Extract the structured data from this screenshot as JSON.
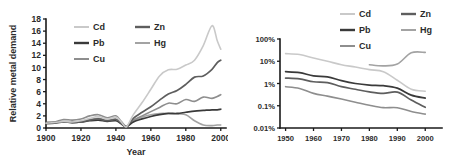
{
  "figure": {
    "background": "#ffffff",
    "panels": [
      "left",
      "right"
    ]
  },
  "series_colors": {
    "Cd": "#c9c9c9",
    "Pb": "#3a3a3a",
    "Cu": "#8e8e8e",
    "Zn": "#5e5e5e",
    "Hg": "#a3a3a3"
  },
  "legend": {
    "entries": [
      {
        "label": "Cd",
        "color": "#c9c9c9"
      },
      {
        "label": "Zn",
        "color": "#5e5e5e"
      },
      {
        "label": "Pb",
        "color": "#3a3a3a"
      },
      {
        "label": "Hg",
        "color": "#a3a3a3"
      },
      {
        "label": "Cu",
        "color": "#8e8e8e"
      }
    ]
  },
  "chart_data": [
    {
      "id": "left",
      "type": "line",
      "title": "",
      "xlabel": "Year",
      "ylabel": "Relative metal demand",
      "xlim": [
        1900,
        2003
      ],
      "ylim": [
        0,
        18
      ],
      "yscale": "linear",
      "grid": false,
      "legend_position": "top-left-inside",
      "xticks": [
        1900,
        1920,
        1940,
        1960,
        1980,
        2000
      ],
      "xticklabels": [
        "1900",
        "1920",
        "1940",
        "1960",
        "1980",
        "2000"
      ],
      "yticks": [
        0,
        2,
        4,
        6,
        8,
        10,
        12,
        14,
        16,
        18
      ],
      "yticklabels": [
        "0",
        "2",
        "4",
        "6",
        "8",
        "10",
        "12",
        "14",
        "16",
        "18"
      ],
      "x": [
        1900,
        1905,
        1910,
        1915,
        1920,
        1925,
        1930,
        1935,
        1940,
        1943,
        1946,
        1950,
        1955,
        1960,
        1965,
        1970,
        1975,
        1980,
        1985,
        1990,
        1995,
        1998,
        2000
      ],
      "series": [
        {
          "name": "Cd",
          "color": "#c9c9c9",
          "values": [
            0.8,
            0.9,
            1.1,
            1.0,
            1.2,
            1.6,
            1.9,
            1.5,
            1.8,
            1.0,
            0.2,
            2.2,
            4.2,
            6.4,
            8.6,
            9.6,
            9.7,
            10.4,
            11.2,
            13.6,
            16.9,
            14.4,
            13.0
          ]
        },
        {
          "name": "Zn",
          "color": "#5e5e5e",
          "values": [
            0.7,
            0.8,
            1.0,
            0.9,
            1.0,
            1.3,
            1.5,
            1.2,
            1.4,
            0.8,
            0.2,
            1.6,
            2.6,
            3.5,
            4.6,
            5.6,
            6.2,
            7.2,
            8.4,
            8.6,
            9.7,
            10.8,
            11.2
          ]
        },
        {
          "name": "Cu",
          "color": "#8e8e8e",
          "values": [
            0.9,
            1.0,
            1.4,
            1.3,
            1.5,
            2.0,
            2.2,
            1.7,
            2.0,
            1.1,
            0.3,
            1.3,
            2.0,
            2.7,
            3.4,
            4.1,
            4.0,
            4.7,
            4.4,
            5.1,
            4.9,
            5.2,
            5.5
          ]
        },
        {
          "name": "Pb",
          "color": "#3a3a3a",
          "values": [
            0.9,
            0.9,
            1.0,
            0.9,
            1.0,
            1.2,
            1.3,
            1.1,
            1.2,
            0.7,
            0.2,
            1.0,
            1.5,
            1.9,
            2.2,
            2.4,
            2.4,
            2.6,
            2.8,
            2.9,
            3.0,
            3.0,
            3.1
          ]
        },
        {
          "name": "Hg",
          "color": "#a3a3a3",
          "values": [
            0.8,
            0.9,
            1.1,
            1.0,
            1.1,
            1.4,
            1.6,
            1.3,
            1.5,
            0.9,
            0.2,
            1.2,
            1.8,
            2.2,
            2.4,
            2.4,
            2.3,
            2.2,
            1.2,
            0.5,
            0.4,
            0.5,
            0.5
          ]
        }
      ]
    },
    {
      "id": "right",
      "type": "line",
      "title": "",
      "xlabel": "",
      "ylabel": "",
      "xlim": [
        1948,
        2006
      ],
      "ylim": [
        0.01,
        100
      ],
      "yscale": "log",
      "grid": false,
      "legend_position": "top-right-outside",
      "xticks": [
        1950,
        1960,
        1970,
        1980,
        1990,
        2000
      ],
      "xticklabels": [
        "1950",
        "1960",
        "1970",
        "1980",
        "1990",
        "2000"
      ],
      "yticks": [
        0.01,
        0.1,
        1,
        10,
        100
      ],
      "yticklabels": [
        "0.01%",
        "0.1%",
        "1%",
        "10%",
        "100%"
      ],
      "x": [
        1950,
        1955,
        1960,
        1965,
        1970,
        1975,
        1980,
        1985,
        1990,
        1995,
        2000
      ],
      "series": [
        {
          "name": "Cd",
          "color": "#c9c9c9",
          "values": [
            22.0,
            20.0,
            14.0,
            10.0,
            7.0,
            5.5,
            4.2,
            3.4,
            1.4,
            0.55,
            0.45
          ]
        },
        {
          "name": "Pb",
          "color": "#3a3a3a",
          "values": [
            3.4,
            3.1,
            2.2,
            2.0,
            1.35,
            1.0,
            0.85,
            0.8,
            0.62,
            0.3,
            0.22
          ]
        },
        {
          "name": "Zn",
          "color": "#5e5e5e",
          "values": [
            1.75,
            1.6,
            1.2,
            1.1,
            0.72,
            0.55,
            0.42,
            0.36,
            0.41,
            0.18,
            0.085
          ]
        },
        {
          "name": "Cu",
          "color": "#8e8e8e",
          "values": [
            0.72,
            0.6,
            0.36,
            0.27,
            0.2,
            0.145,
            0.105,
            0.082,
            0.082,
            0.055,
            0.042
          ]
        },
        {
          "name": "Hg",
          "color": "#a3a3a3",
          "values": [
            null,
            null,
            null,
            null,
            null,
            null,
            7.0,
            6.2,
            7.5,
            24.0,
            25.0
          ]
        }
      ]
    }
  ]
}
